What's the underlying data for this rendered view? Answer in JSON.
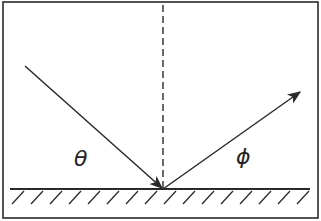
{
  "diagram": {
    "labels": {
      "incident_angle": "θ",
      "reflected_angle": "ϕ"
    },
    "colors": {
      "stroke": "#2a2a2a",
      "background": "#ffffff"
    },
    "geometry": {
      "frame": [
        3,
        2,
        315,
        216
      ],
      "surface_y": 189,
      "surface_x": [
        10,
        310
      ],
      "reflection_point": [
        163,
        189
      ],
      "incident_start": [
        25,
        66
      ],
      "reflected_end": [
        300,
        92
      ],
      "normal_top": 5
    }
  }
}
